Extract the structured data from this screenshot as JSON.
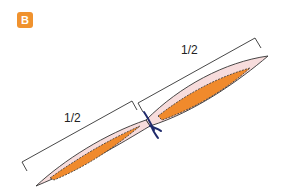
{
  "badge": {
    "label": "B",
    "color": "#f0922e"
  },
  "measurements": {
    "upper_label": "1/2",
    "lower_label": "1/2"
  },
  "colors": {
    "outer_fill": "#f7dcdc",
    "inner_fill": "#f08a2c",
    "outline": "#333333",
    "knot": "#1f2a6b",
    "bracket": "#333333"
  }
}
